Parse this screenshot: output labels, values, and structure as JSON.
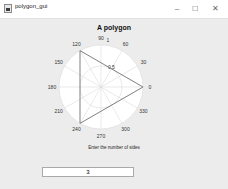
{
  "window": {
    "title": "polygon_gui",
    "controls": {
      "minimize": "–",
      "maximize": "☐",
      "close": "✕"
    }
  },
  "chart_data": {
    "type": "polar-line",
    "title": "A polygon",
    "theta_ticks": [
      "0",
      "30",
      "60",
      "90",
      "120",
      "150",
      "180",
      "210",
      "240",
      "270",
      "300",
      "330"
    ],
    "r_ticks": [
      "0.5",
      "1"
    ],
    "rlim": [
      0,
      1
    ],
    "series": [
      {
        "name": "polygon",
        "theta_deg": [
          0,
          120,
          240,
          360
        ],
        "r": [
          1,
          1,
          1,
          1
        ]
      }
    ],
    "grid": true
  },
  "form": {
    "label": "Enter the number of sides",
    "value": "3"
  }
}
